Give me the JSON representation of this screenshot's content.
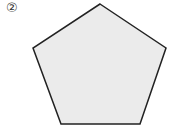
{
  "figure": {
    "label": "②",
    "shape": "pentagon",
    "fill": "#ebebeb",
    "stroke": "#222222",
    "points": "100,4 166,48 140,124 61,124 33,48"
  }
}
